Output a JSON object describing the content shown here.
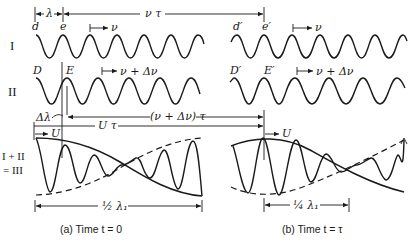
{
  "figure": {
    "row_labels": {
      "wave1": "I",
      "wave2": "II",
      "sum_line1": "I + II",
      "sum_line2": "= III"
    },
    "top_dims": {
      "lambda": "λ",
      "nu_tau": "ν τ"
    },
    "points_a": {
      "d": "d",
      "e": "e",
      "D": "D",
      "E": "E"
    },
    "points_b": {
      "d": "d′",
      "e": "e′",
      "D": "D′",
      "E": "E′"
    },
    "velocities": {
      "v1": "ν",
      "v2": "ν + Δν",
      "group": "U"
    },
    "mid_dims": {
      "delta_lambda": "Δλ",
      "nu_dnu_tau": "(ν + Δν) τ",
      "u_tau": "U τ"
    },
    "bottom_dims": {
      "half": "½ λ₁",
      "quarter": "¼ λ₁"
    },
    "captions": {
      "a": "(a) Time  t = 0",
      "b": "(b) Time  t = τ"
    }
  },
  "colors": {
    "ink": "#1a1a1a",
    "background": "#ffffff"
  }
}
